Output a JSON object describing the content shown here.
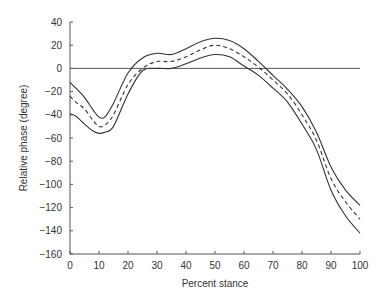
{
  "chart_data": {
    "type": "line",
    "title": "",
    "xlabel": "Percent stance",
    "ylabel": "Relative phase (degree)",
    "xlim": [
      0,
      100
    ],
    "ylim": [
      -160,
      40
    ],
    "xticks": [
      0,
      10,
      20,
      30,
      40,
      50,
      60,
      70,
      80,
      90,
      100
    ],
    "yticks": [
      40,
      20,
      0,
      -20,
      -40,
      -60,
      -80,
      -100,
      -120,
      -140,
      -160
    ],
    "grid": false,
    "legend": null,
    "reference_line": {
      "y": 0,
      "style": "solid"
    },
    "x": [
      0,
      2,
      5,
      8,
      10,
      12,
      15,
      20,
      25,
      30,
      35,
      40,
      45,
      50,
      55,
      60,
      65,
      70,
      75,
      80,
      85,
      90,
      95,
      100
    ],
    "series": [
      {
        "name": "Mean + SD",
        "style": "solid",
        "values": [
          -12,
          -17,
          -25,
          -36,
          -42,
          -42,
          -30,
          -4,
          9,
          13,
          12,
          17,
          23,
          26,
          24,
          17,
          6,
          -6,
          -18,
          -33,
          -55,
          -85,
          -105,
          -118
        ]
      },
      {
        "name": "Mean",
        "style": "dashed",
        "values": [
          -24,
          -29,
          -35,
          -45,
          -50,
          -49,
          -40,
          -14,
          0,
          6,
          6,
          10,
          16,
          20,
          17,
          10,
          1,
          -10,
          -22,
          -40,
          -62,
          -95,
          -115,
          -130
        ]
      },
      {
        "name": "Mean - SD",
        "style": "solid",
        "values": [
          -39,
          -41,
          -48,
          -54,
          -56,
          -55,
          -50,
          -22,
          -2,
          0,
          0,
          4,
          9,
          12,
          10,
          2,
          -6,
          -17,
          -29,
          -48,
          -70,
          -105,
          -127,
          -142
        ]
      }
    ]
  },
  "colors": {
    "line": "#333333",
    "axis": "#555555",
    "text": "#333333",
    "background": "#ffffff"
  }
}
